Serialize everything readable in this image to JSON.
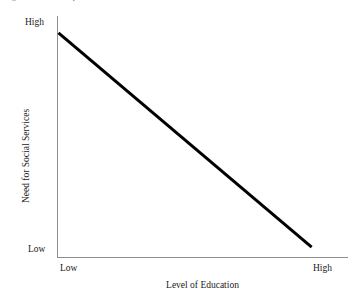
{
  "figure": {
    "title_partial": "Negative relationship between education and need for social services",
    "background_color": "#ffffff",
    "axis_color": "#8d8d8d",
    "line_color": "#000000",
    "text_color": "#1a1a1a"
  },
  "chart_data": {
    "type": "line",
    "title": "",
    "xlabel": "Level of Education",
    "ylabel": "Need for Social Services",
    "x_tick_labels": [
      "Low",
      "High"
    ],
    "y_tick_labels": [
      "Low",
      "High"
    ],
    "xlim": [
      0,
      1
    ],
    "ylim": [
      0,
      1
    ],
    "grid": false,
    "legend": "none",
    "series": [
      {
        "name": "Need for Social Services vs Level of Education",
        "relationship": "negative linear",
        "x": [
          0.005,
          0.875
        ],
        "y": [
          0.93,
          0.045
        ],
        "color": "#000000",
        "line_width": 3
      }
    ],
    "annotations": []
  }
}
